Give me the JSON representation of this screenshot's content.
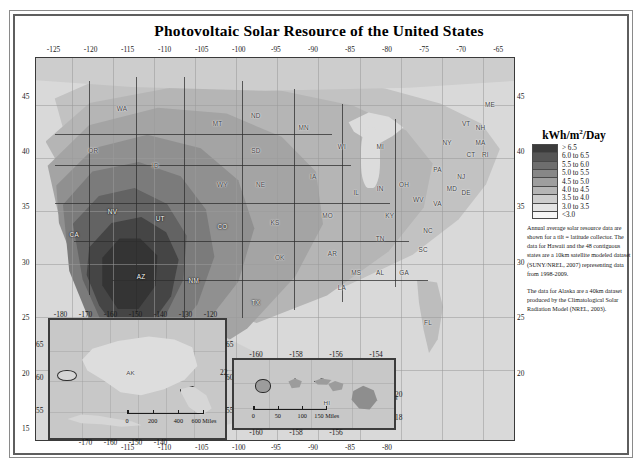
{
  "figure": {
    "title": "Photovoltaic Solar Resource of the United States"
  },
  "legend": {
    "title_main": "kWh/m",
    "title_sup": "2",
    "title_tail": "/Day",
    "classes": [
      {
        "label": "> 6.5",
        "color": "#3b3b3b"
      },
      {
        "label": "6.0 to 6.5",
        "color": "#555555"
      },
      {
        "label": "5.5 to 6.0",
        "color": "#6e6e6e"
      },
      {
        "label": "5.0 to 5.5",
        "color": "#878787"
      },
      {
        "label": "4.5 to 5.0",
        "color": "#9e9e9e"
      },
      {
        "label": "4.0 to 4.5",
        "color": "#b5b5b5"
      },
      {
        "label": "3.5 to 4.0",
        "color": "#cdcdcd"
      },
      {
        "label": "3.0 to 3.5",
        "color": "#e4e4e4"
      },
      {
        "label": "<3.0",
        "color": "#f7f7f7"
      }
    ]
  },
  "captions": {
    "paragraph1": "Annual average solar resource data are shown for a tilt = latitude collector. The data for Hawaii and the 48 contiguous states are a 10km satellite modeled dataset (SUNY/NREL, 2007) representing data from 1998-2009.",
    "paragraph2": "The data for Alaska are a 40km dataset produced by the Climatological Solar Radiation Model (NREL, 2003)."
  },
  "main_map": {
    "lon_ticks_top": [
      "-125",
      "-120",
      "-115",
      "-110",
      "-105",
      "-100",
      "-95",
      "-90",
      "-85",
      "-80",
      "-75",
      "-70",
      "-65"
    ],
    "lon_ticks_bottom": [
      "-115",
      "-110",
      "-105",
      "-100",
      "-95",
      "-90",
      "-85",
      "-80"
    ],
    "lat_ticks_left": [
      "45",
      "40",
      "35",
      "30",
      "25",
      "20",
      "15"
    ],
    "lat_ticks_right": [
      "45",
      "40",
      "35",
      "30",
      "25",
      "20"
    ],
    "scalebar": {
      "labels": [
        "0",
        "150",
        "300",
        "450",
        "600 Miles"
      ]
    },
    "state_labels": [
      {
        "abbr": "WA",
        "x": 18,
        "y": 13,
        "tone": "lt"
      },
      {
        "abbr": "OR",
        "x": 12,
        "y": 24,
        "tone": "lt"
      },
      {
        "abbr": "ID",
        "x": 25,
        "y": 28,
        "tone": "lt"
      },
      {
        "abbr": "MT",
        "x": 38,
        "y": 17,
        "tone": "lt"
      },
      {
        "abbr": "WY",
        "x": 39,
        "y": 33,
        "tone": "lt"
      },
      {
        "abbr": "NV",
        "x": 16,
        "y": 40,
        "tone": "dk"
      },
      {
        "abbr": "UT",
        "x": 26,
        "y": 42,
        "tone": "dk"
      },
      {
        "abbr": "CA",
        "x": 8,
        "y": 46,
        "tone": "dk"
      },
      {
        "abbr": "CO",
        "x": 39,
        "y": 44,
        "tone": "dk"
      },
      {
        "abbr": "AZ",
        "x": 22,
        "y": 57,
        "tone": "dk"
      },
      {
        "abbr": "NM",
        "x": 33,
        "y": 58,
        "tone": "dk"
      },
      {
        "abbr": "ND",
        "x": 46,
        "y": 15,
        "tone": "lt"
      },
      {
        "abbr": "SD",
        "x": 46,
        "y": 24,
        "tone": "lt"
      },
      {
        "abbr": "NE",
        "x": 47,
        "y": 33,
        "tone": "lt"
      },
      {
        "abbr": "KS",
        "x": 50,
        "y": 43,
        "tone": "lt"
      },
      {
        "abbr": "OK",
        "x": 51,
        "y": 52,
        "tone": "lt"
      },
      {
        "abbr": "TX",
        "x": 46,
        "y": 64,
        "tone": "dk"
      },
      {
        "abbr": "MN",
        "x": 56,
        "y": 18,
        "tone": "lt"
      },
      {
        "abbr": "IA",
        "x": 58,
        "y": 31,
        "tone": "lt"
      },
      {
        "abbr": "MO",
        "x": 61,
        "y": 41,
        "tone": "lt"
      },
      {
        "abbr": "AR",
        "x": 62,
        "y": 51,
        "tone": "lt"
      },
      {
        "abbr": "LA",
        "x": 64,
        "y": 60,
        "tone": "lt"
      },
      {
        "abbr": "WI",
        "x": 64,
        "y": 23,
        "tone": "lt"
      },
      {
        "abbr": "IL",
        "x": 67,
        "y": 35,
        "tone": "lt"
      },
      {
        "abbr": "IN",
        "x": 72,
        "y": 34,
        "tone": "lt"
      },
      {
        "abbr": "MI",
        "x": 72,
        "y": 23,
        "tone": "lt"
      },
      {
        "abbr": "OH",
        "x": 77,
        "y": 33,
        "tone": "lt"
      },
      {
        "abbr": "KY",
        "x": 74,
        "y": 41,
        "tone": "lt"
      },
      {
        "abbr": "TN",
        "x": 72,
        "y": 47,
        "tone": "lt"
      },
      {
        "abbr": "MS",
        "x": 67,
        "y": 56,
        "tone": "lt"
      },
      {
        "abbr": "AL",
        "x": 72,
        "y": 56,
        "tone": "lt"
      },
      {
        "abbr": "GA",
        "x": 77,
        "y": 56,
        "tone": "lt"
      },
      {
        "abbr": "FL",
        "x": 82,
        "y": 69,
        "tone": "lt"
      },
      {
        "abbr": "SC",
        "x": 81,
        "y": 50,
        "tone": "lt"
      },
      {
        "abbr": "NC",
        "x": 82,
        "y": 45,
        "tone": "lt"
      },
      {
        "abbr": "VA",
        "x": 84,
        "y": 38,
        "tone": "lt"
      },
      {
        "abbr": "WV",
        "x": 80,
        "y": 37,
        "tone": "lt"
      },
      {
        "abbr": "PA",
        "x": 84,
        "y": 29,
        "tone": "lt"
      },
      {
        "abbr": "NY",
        "x": 86,
        "y": 22,
        "tone": "lt"
      },
      {
        "abbr": "MD",
        "x": 87,
        "y": 34,
        "tone": "lt"
      },
      {
        "abbr": "DE",
        "x": 90,
        "y": 35,
        "tone": "lt"
      },
      {
        "abbr": "NJ",
        "x": 89,
        "y": 31,
        "tone": "lt"
      },
      {
        "abbr": "CT",
        "x": 91,
        "y": 25,
        "tone": "lt"
      },
      {
        "abbr": "RI",
        "x": 94,
        "y": 25,
        "tone": "lt"
      },
      {
        "abbr": "MA",
        "x": 93,
        "y": 22,
        "tone": "lt"
      },
      {
        "abbr": "NH",
        "x": 93,
        "y": 18,
        "tone": "lt"
      },
      {
        "abbr": "VT",
        "x": 90,
        "y": 17,
        "tone": "lt"
      },
      {
        "abbr": "ME",
        "x": 95,
        "y": 12,
        "tone": "lt"
      }
    ]
  },
  "alaska_inset": {
    "label": "AK",
    "lon_ticks_top": [
      "-180",
      "-170",
      "-160",
      "-150",
      "-140",
      "-130",
      "-120"
    ],
    "lon_ticks_bottom": [
      "-170",
      "-160",
      "-150",
      "-140"
    ],
    "lat_ticks_left": [
      "65",
      "60",
      "55"
    ],
    "lat_ticks_right": [
      "65",
      "60",
      "55"
    ],
    "scalebar": {
      "labels": [
        "0",
        "200",
        "400",
        "600 Miles"
      ]
    }
  },
  "hawaii_inset": {
    "label": "HI",
    "lon_ticks_top": [
      "-160",
      "-158",
      "-156",
      "-154"
    ],
    "lon_ticks_bottom": [
      "-160",
      "-158",
      "-156"
    ],
    "lat_ticks_left": [
      "22"
    ],
    "lat_ticks_right": [
      "20",
      "18"
    ],
    "scalebar": {
      "labels": [
        "0",
        "50",
        "100",
        "150 Miles"
      ]
    }
  }
}
